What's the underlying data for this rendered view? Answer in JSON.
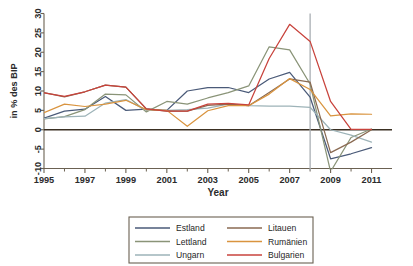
{
  "chart_data": {
    "type": "line",
    "title": "",
    "xlabel": "Year",
    "ylabel": "in % des BIP",
    "xlim": [
      1995,
      2012
    ],
    "ylim": [
      -10,
      30
    ],
    "xticks": [
      1995,
      1997,
      1999,
      2001,
      2003,
      2005,
      2007,
      2009,
      2011
    ],
    "xtick_labels": [
      "1995",
      "1997",
      "1999",
      "2001",
      "2003",
      "2005",
      "2007",
      "2009",
      "2011"
    ],
    "xminor_ticks": [
      1996,
      1998,
      2000,
      2002,
      2004,
      2006,
      2008,
      2010
    ],
    "yticks": [
      -10,
      -5,
      0,
      5,
      10,
      15,
      20,
      25,
      30
    ],
    "ytick_labels": [
      "-10",
      "-5",
      "0",
      "5",
      "10",
      "15",
      "20",
      "25",
      "30"
    ],
    "grid": false,
    "zero_line": 0,
    "vertical_marker": {
      "x": 2008,
      "color": "#a9aeb3",
      "label": ""
    },
    "legend_position": "bottom",
    "x": [
      1995,
      1996,
      1997,
      1998,
      1999,
      2000,
      2001,
      2002,
      2003,
      2004,
      2005,
      2006,
      2007,
      2008,
      2009,
      2010,
      2011
    ],
    "series": [
      {
        "name": "Estland",
        "color": "#4a5a78",
        "values": [
          3.0,
          4.8,
          5.3,
          8.6,
          5.0,
          5.3,
          5.0,
          10.0,
          10.9,
          10.9,
          9.6,
          13.1,
          14.8,
          8.4,
          -7.5,
          -6.2,
          -4.6
        ]
      },
      {
        "name": "Lettland",
        "color": "#8a9478",
        "values": [
          2.8,
          3.4,
          5.2,
          9.2,
          9.0,
          4.6,
          7.3,
          6.6,
          8.2,
          9.6,
          11.3,
          21.4,
          20.6,
          11.8,
          -10.8,
          -2.0,
          0.2
        ]
      },
      {
        "name": "Ungarn",
        "color": "#9db3b8",
        "values": [
          2.9,
          3.3,
          3.5,
          6.9,
          7.8,
          5.0,
          5.0,
          5.2,
          5.6,
          6.6,
          6.2,
          6.1,
          6.1,
          5.8,
          0.0,
          -1.4,
          -3.2
        ]
      },
      {
        "name": "Litauen",
        "color": "#8a6a52",
        "values": [
          9.6,
          8.5,
          9.8,
          11.5,
          11.0,
          5.4,
          4.8,
          4.8,
          6.3,
          6.6,
          6.2,
          9.6,
          13.1,
          12.3,
          -5.9,
          -3.2,
          0.0
        ]
      },
      {
        "name": "Rumänien",
        "color": "#d9943f",
        "values": [
          4.4,
          6.6,
          6.0,
          6.6,
          7.6,
          5.2,
          5.0,
          0.9,
          4.9,
          6.2,
          6.2,
          9.2,
          13.2,
          10.4,
          3.6,
          4.1,
          4.0
        ]
      },
      {
        "name": "Bulgarien",
        "color": "#c8433c",
        "values": [
          9.5,
          8.6,
          9.8,
          11.5,
          11.0,
          5.4,
          4.8,
          4.8,
          6.6,
          6.8,
          6.4,
          18.4,
          27.2,
          22.8,
          7.3,
          0.1,
          0.1
        ]
      }
    ]
  },
  "legend": {
    "entries": [
      {
        "label": "Estland",
        "color": "#4a5a78"
      },
      {
        "label": "Litauen",
        "color": "#8a6a52"
      },
      {
        "label": "Lettland",
        "color": "#8a9478"
      },
      {
        "label": "Rumänien",
        "color": "#d9943f"
      },
      {
        "label": "Ungarn",
        "color": "#9db3b8"
      },
      {
        "label": "Bulgarien",
        "color": "#c8433c"
      }
    ]
  }
}
